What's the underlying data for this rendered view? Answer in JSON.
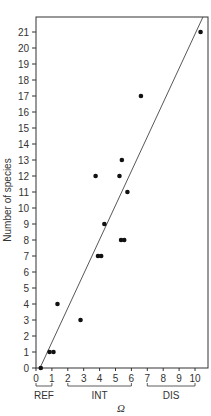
{
  "chart_data": {
    "type": "scatter",
    "title": "",
    "xlabel": "Ω",
    "ylabel": "Number of species",
    "xlim": [
      0,
      10.8
    ],
    "ylim": [
      0,
      22
    ],
    "x_ticks": [
      0,
      1,
      2,
      3,
      4,
      5,
      6,
      7,
      8,
      9,
      10
    ],
    "y_ticks": [
      0,
      1,
      2,
      3,
      4,
      5,
      6,
      7,
      8,
      9,
      10,
      11,
      12,
      13,
      14,
      15,
      16,
      17,
      18,
      19,
      20,
      21
    ],
    "grid": false,
    "legend": null,
    "x_groups": [
      {
        "label": "REF",
        "from": 0,
        "to": 1
      },
      {
        "label": "INT",
        "from": 2,
        "to": 6
      },
      {
        "label": "DIS",
        "from": 7,
        "to": 10
      }
    ],
    "series": [
      {
        "name": "sites",
        "points": [
          {
            "x": 0.3,
            "y": 0
          },
          {
            "x": 0.85,
            "y": 1
          },
          {
            "x": 1.1,
            "y": 1
          },
          {
            "x": 1.35,
            "y": 4
          },
          {
            "x": 2.8,
            "y": 3
          },
          {
            "x": 3.75,
            "y": 12
          },
          {
            "x": 3.9,
            "y": 7
          },
          {
            "x": 4.1,
            "y": 7
          },
          {
            "x": 4.3,
            "y": 9
          },
          {
            "x": 5.25,
            "y": 12
          },
          {
            "x": 5.35,
            "y": 8
          },
          {
            "x": 5.55,
            "y": 8
          },
          {
            "x": 5.4,
            "y": 13
          },
          {
            "x": 5.75,
            "y": 11
          },
          {
            "x": 6.6,
            "y": 17
          },
          {
            "x": 10.35,
            "y": 21
          }
        ]
      }
    ],
    "fit_line": {
      "x1": 0.25,
      "y1": 0,
      "x2": 10.5,
      "y2": 22
    }
  },
  "colors": {
    "axis": "#333333",
    "point": "#111111",
    "line": "#444444",
    "text": "#333333"
  }
}
